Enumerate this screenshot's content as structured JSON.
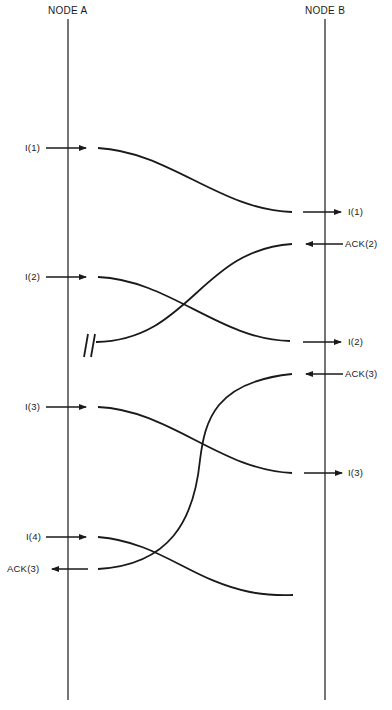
{
  "diagram": {
    "nodes": [
      {
        "id": "A",
        "label": "NODE A"
      },
      {
        "id": "B",
        "label": "NODE B"
      }
    ],
    "messages": [
      {
        "from": "A",
        "to": "B",
        "frame": "I(1)",
        "sent_label": "I(1)",
        "received_label": "I(1)",
        "status": "delivered"
      },
      {
        "from": "B",
        "to": "A",
        "frame": "ACK(2)",
        "sent_label": "ACK(2)",
        "received_label": "",
        "status": "lost"
      },
      {
        "from": "A",
        "to": "B",
        "frame": "I(2)",
        "sent_label": "I(2)",
        "received_label": "I(2)",
        "status": "delivered"
      },
      {
        "from": "B",
        "to": "A",
        "frame": "ACK(3)",
        "sent_label": "ACK(3)",
        "received_label": "ACK(3)",
        "status": "delivered"
      },
      {
        "from": "A",
        "to": "B",
        "frame": "I(3)",
        "sent_label": "I(3)",
        "received_label": "I(3)",
        "status": "delivered"
      },
      {
        "from": "A",
        "to": "B",
        "frame": "I(4)",
        "sent_label": "I(4)",
        "received_label": "",
        "status": "in-transit"
      }
    ],
    "labels": {
      "a_i1": "I(1)",
      "b_i1": "I(1)",
      "b_ack2": "ACK(2)",
      "a_i2": "I(2)",
      "b_i2": "I(2)",
      "b_ack3": "ACK(3)",
      "a_i3": "I(3)",
      "b_i3": "I(3)",
      "a_i4": "I(4)",
      "a_ack3": "ACK(3)"
    },
    "colors": {
      "ink": "#1a1a1a",
      "background": "#ffffff"
    }
  }
}
